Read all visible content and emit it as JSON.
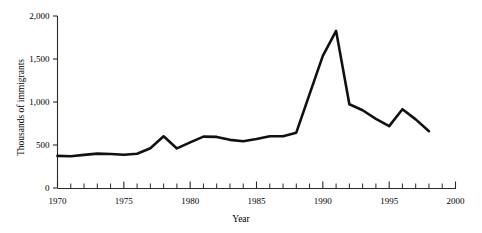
{
  "chart_data": {
    "type": "line",
    "title": "",
    "xlabel": "Year",
    "ylabel": "Thousands of immigrants",
    "xlim": [
      1970,
      2000
    ],
    "ylim": [
      0,
      2000
    ],
    "grid": false,
    "legend": false,
    "x_tick_labels": [
      "1970",
      "1975",
      "1980",
      "1985",
      "1990",
      "1995",
      "2000"
    ],
    "x_tick_values": [
      1970,
      1975,
      1980,
      1985,
      1990,
      1995,
      2000
    ],
    "x_minor_tick_step": 1,
    "y_tick_labels": [
      "0",
      "500",
      "1,000",
      "1,500",
      "2,000"
    ],
    "y_tick_values": [
      0,
      500,
      1000,
      1500,
      2000
    ],
    "series": [
      {
        "name": "Immigrants admitted",
        "color": "#111111",
        "line_width": 2.6,
        "x": [
          1970,
          1971,
          1972,
          1973,
          1974,
          1975,
          1976,
          1977,
          1978,
          1979,
          1980,
          1981,
          1982,
          1983,
          1984,
          1985,
          1986,
          1987,
          1988,
          1989,
          1990,
          1991,
          1992,
          1993,
          1994,
          1995,
          1996,
          1997,
          1998
        ],
        "values": [
          373,
          370,
          385,
          400,
          395,
          386,
          399,
          462,
          601,
          460,
          531,
          597,
          594,
          560,
          544,
          570,
          602,
          602,
          643,
          1091,
          1536,
          1827,
          974,
          904,
          804,
          720,
          916,
          798,
          660
        ]
      }
    ]
  },
  "axes": {
    "y_axis_name": "y-axis",
    "x_axis_name": "x-axis"
  }
}
